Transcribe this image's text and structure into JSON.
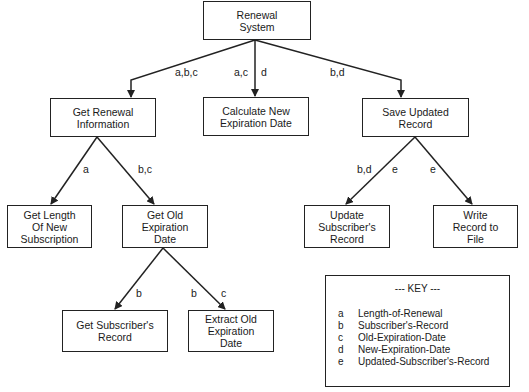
{
  "diagram": {
    "nodes": {
      "root": "Renewal\nSystem",
      "get_renewal_info": "Get Renewal\nInformation",
      "calc_new_exp": "Calculate New\nExpiration Date",
      "save_updated": "Save Updated\nRecord",
      "get_length": "Get Length\nOf New\nSubscription",
      "get_old_exp": "Get Old\nExpiration\nDate",
      "update_subscriber": "Update\nSubscriber's\nRecord",
      "write_record": "Write\nRecord to\nFile",
      "get_subscriber_record": "Get  Subscriber's\nRecord",
      "extract_old_exp": "Extract Old\nExpiration\nDate"
    },
    "edge_labels": {
      "root_to_info": "a,b,c",
      "root_to_calc_in": "a,c",
      "root_to_calc_out": "d",
      "root_to_save": "b,d",
      "info_to_length": "a",
      "info_to_oldexp": "b,c",
      "save_to_update_in": "b,d",
      "save_to_update_out": "e",
      "save_to_write": "e",
      "oldexp_to_getsub": "b",
      "oldexp_to_extract_in": "b",
      "oldexp_to_extract_out": "c"
    },
    "key": {
      "title": "--- KEY ---",
      "items": [
        {
          "letter": "a",
          "meaning": "Length-of-Renewal"
        },
        {
          "letter": "b",
          "meaning": "Subscriber's-Record"
        },
        {
          "letter": "c",
          "meaning": "Old-Expiration-Date"
        },
        {
          "letter": "d",
          "meaning": "New-Expiration-Date"
        },
        {
          "letter": "e",
          "meaning": "Updated-Subscriber's-Record"
        }
      ]
    }
  }
}
